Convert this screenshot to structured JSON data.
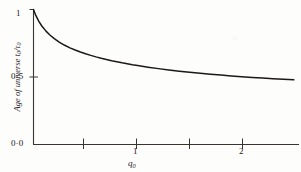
{
  "figure": {
    "background_color": "#fdfdfc",
    "ink_color": "#25211e"
  },
  "chart_data": {
    "type": "line",
    "title": "",
    "subtitle": "",
    "xlabel": "q0",
    "xlabel_display": "q",
    "xlabel_subscript": "0",
    "ylabel": "Age of universe t0/τ0",
    "ylabel_text_prefix": "Age of universe ",
    "ylabel_numerator": "t",
    "ylabel_numerator_sub": "0",
    "ylabel_slash": "/",
    "ylabel_denominator": "τ",
    "ylabel_denominator_sub": "0",
    "xlim": [
      0,
      2.55
    ],
    "ylim": [
      0,
      1.05
    ],
    "grid": false,
    "legend": null,
    "x_ticks": [
      0.5,
      1.0,
      1.5,
      2.0
    ],
    "x_tick_labels": [
      "",
      "1",
      "",
      "2"
    ],
    "y_ticks": [
      0.0,
      0.5,
      1.0
    ],
    "y_tick_labels": [
      "0·0",
      "0·5",
      "1"
    ],
    "series": [
      {
        "name": "t0/tau0 vs q0",
        "x": [
          0.0,
          0.02,
          0.05,
          0.08,
          0.12,
          0.16,
          0.2,
          0.25,
          0.3,
          0.35,
          0.4,
          0.45,
          0.5,
          0.55,
          0.6,
          0.65,
          0.7,
          0.75,
          0.8,
          0.85,
          0.9,
          0.95,
          1.0,
          1.1,
          1.2,
          1.3,
          1.4,
          1.5,
          1.6,
          1.7,
          1.8,
          1.9,
          2.0,
          2.1,
          2.2,
          2.3,
          2.4,
          2.5
        ],
        "y": [
          1.0,
          0.96,
          0.914,
          0.878,
          0.84,
          0.809,
          0.784,
          0.757,
          0.735,
          0.716,
          0.7,
          0.685,
          0.672,
          0.66,
          0.649,
          0.639,
          0.63,
          0.621,
          0.613,
          0.605,
          0.598,
          0.591,
          0.585,
          0.573,
          0.562,
          0.552,
          0.543,
          0.535,
          0.527,
          0.52,
          0.514,
          0.508,
          0.502,
          0.497,
          0.492,
          0.487,
          0.483,
          0.479
        ]
      }
    ]
  },
  "axes": {
    "y_tick_1": "1",
    "y_tick_05": "0·5",
    "y_tick_00": "0·0",
    "x_tick_1": "1",
    "x_tick_2": "2"
  }
}
